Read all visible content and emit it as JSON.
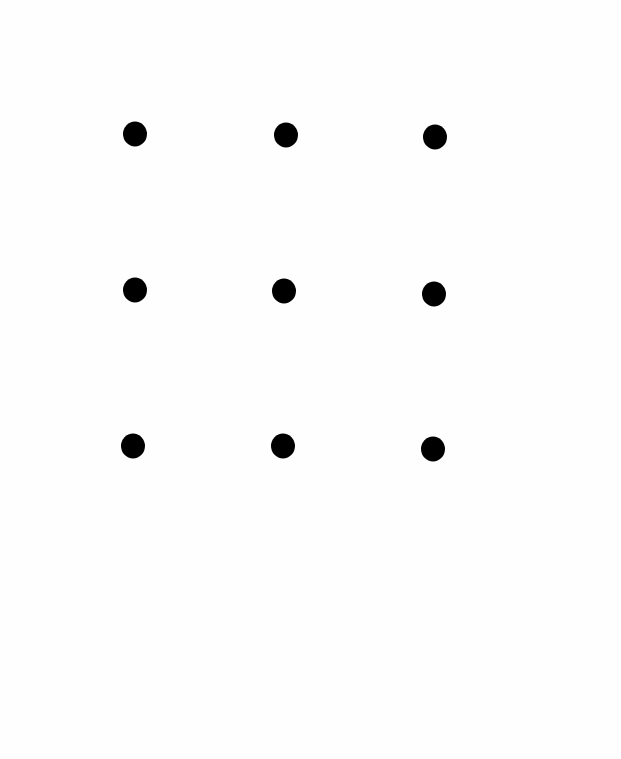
{
  "diagram": {
    "type": "dot-grid",
    "rows": 3,
    "cols": 3,
    "background": "#fefefe",
    "dot_color": "#000000",
    "dot_size": {
      "w": 24,
      "h": 25
    },
    "dots": [
      {
        "row": 1,
        "col": 1,
        "x": 135,
        "y": 134
      },
      {
        "row": 1,
        "col": 2,
        "x": 286,
        "y": 135
      },
      {
        "row": 1,
        "col": 3,
        "x": 435,
        "y": 137
      },
      {
        "row": 2,
        "col": 1,
        "x": 135,
        "y": 290
      },
      {
        "row": 2,
        "col": 2,
        "x": 284,
        "y": 291
      },
      {
        "row": 2,
        "col": 3,
        "x": 434,
        "y": 294
      },
      {
        "row": 3,
        "col": 1,
        "x": 133,
        "y": 446
      },
      {
        "row": 3,
        "col": 2,
        "x": 283,
        "y": 446
      },
      {
        "row": 3,
        "col": 3,
        "x": 433,
        "y": 449
      }
    ]
  }
}
